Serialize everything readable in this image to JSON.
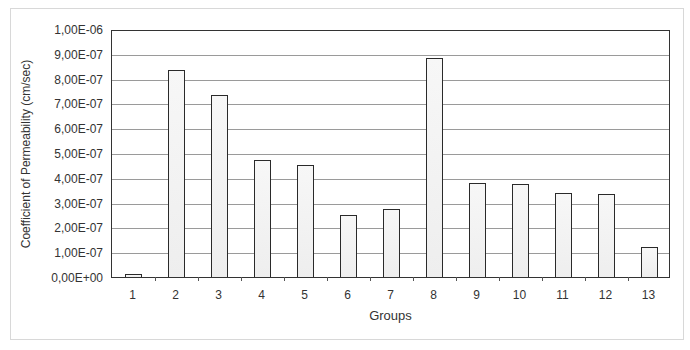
{
  "chart_data": {
    "type": "bar",
    "title": "",
    "xlabel": "Groups",
    "ylabel": "Coefficient of Permeability (cm/sec)",
    "categories": [
      "1",
      "2",
      "3",
      "4",
      "5",
      "6",
      "7",
      "8",
      "9",
      "10",
      "11",
      "12",
      "13"
    ],
    "values": [
      1e-08,
      8.35e-07,
      7.35e-07,
      4.7e-07,
      4.5e-07,
      2.5e-07,
      2.75e-07,
      8.85e-07,
      3.8e-07,
      3.75e-07,
      3.4e-07,
      3.35e-07,
      1.2e-07
    ],
    "ylim": [
      0,
      1e-06
    ],
    "yticks": [
      "0,00E+00",
      "1,00E-07",
      "2,00E-07",
      "3,00E-07",
      "4,00E-07",
      "5,00E-07",
      "6,00E-07",
      "7,00E-07",
      "8,00E-07",
      "9,00E-07",
      "1,00E-06"
    ],
    "grid": true,
    "legend": null
  }
}
